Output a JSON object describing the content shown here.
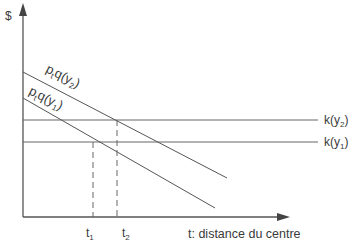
{
  "diagram": {
    "y_axis_label": "$",
    "x_axis_label": "t: distance du centre",
    "curves": [
      {
        "id": "bid_rent_y2",
        "label_base": "p",
        "label_sub1": "t",
        "label_mid": "q(y",
        "label_sub2": "2",
        "label_end": ")"
      },
      {
        "id": "bid_rent_y1",
        "label_base": "p",
        "label_sub1": "t",
        "label_mid": "q(y",
        "label_sub2": "1",
        "label_end": ")"
      }
    ],
    "horizontal_lines": [
      {
        "id": "k_y2",
        "label_base": "k(y",
        "label_sub": "2",
        "label_end": ")"
      },
      {
        "id": "k_y1",
        "label_base": "k(y",
        "label_sub": "1",
        "label_end": ")"
      }
    ],
    "markers": [
      {
        "id": "t1",
        "label_base": "t",
        "label_sub": "1"
      },
      {
        "id": "t2",
        "label_base": "t",
        "label_sub": "2"
      }
    ],
    "colors": {
      "line": "#555555",
      "text": "#3a3a3a"
    }
  }
}
